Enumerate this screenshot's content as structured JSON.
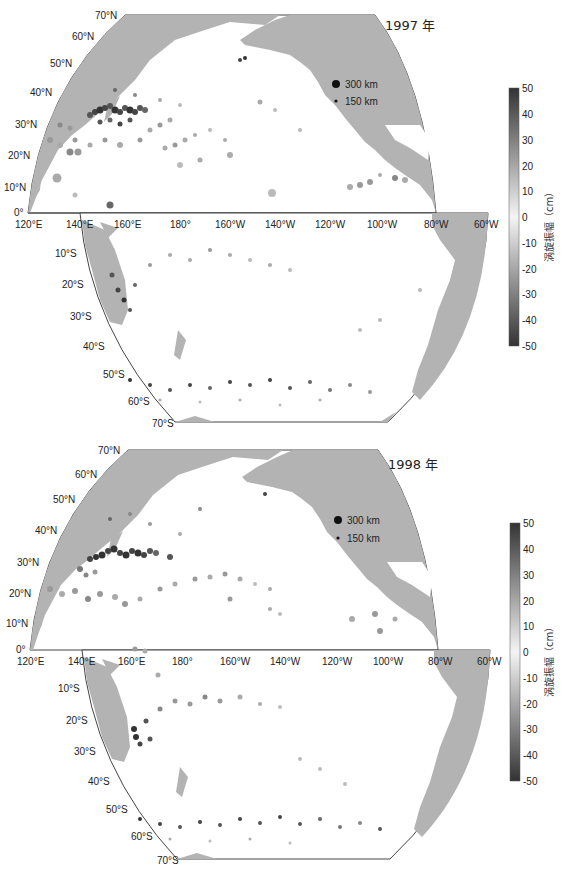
{
  "figure": {
    "colormap": {
      "label": "涡旋振幅（cm）",
      "unit": "cm",
      "ticks": [
        "50",
        "40",
        "30",
        "20",
        "10",
        "0",
        "-10",
        "-20",
        "-30",
        "-40",
        "-50"
      ],
      "range": [
        -50,
        50
      ],
      "colors": {
        "max": "#333333",
        "zero": "#f4f4f4",
        "min": "#333333"
      }
    },
    "size_legend": [
      {
        "label": "300 km",
        "radius": 4
      },
      {
        "label": "150 km",
        "radius": 2
      }
    ],
    "land_color": "#b3b3b3",
    "ocean_color": "#ffffff",
    "lon_labels": [
      "120°E",
      "140°E",
      "160°E",
      "180°",
      "160°W",
      "140°W",
      "120°W",
      "100°W",
      "80°W",
      "60°W"
    ],
    "lat_labels_north": [
      "70°N",
      "60°N",
      "50°N",
      "40°N",
      "30°N",
      "20°N",
      "10°N",
      "0°"
    ],
    "lat_labels_south": [
      "10°S",
      "20°S",
      "30°S",
      "40°S",
      "50°S",
      "60°S",
      "70°S"
    ]
  },
  "panels": [
    {
      "title": "1997 年",
      "year": "1997"
    },
    {
      "title": "1998 年",
      "year": "1998"
    }
  ]
}
